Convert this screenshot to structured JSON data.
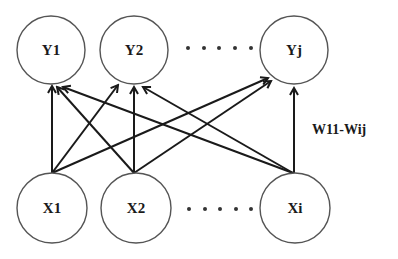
{
  "diagram": {
    "type": "bipartite-network",
    "output_nodes": [
      {
        "id": "Y1",
        "label": "Y1",
        "cx": 51,
        "cy": 50,
        "r": 34
      },
      {
        "id": "Y2",
        "label": "Y2",
        "cx": 134,
        "cy": 50,
        "r": 34
      },
      {
        "id": "Yj",
        "label": "Yj",
        "cx": 294,
        "cy": 50,
        "r": 34
      }
    ],
    "input_nodes": [
      {
        "id": "X1",
        "label": "X1",
        "cx": 52,
        "cy": 208,
        "r": 35
      },
      {
        "id": "X2",
        "label": "X2",
        "cx": 136,
        "cy": 208,
        "r": 35
      },
      {
        "id": "Xi",
        "label": "Xi",
        "cx": 295,
        "cy": 208,
        "r": 35
      }
    ],
    "edges": [
      {
        "from": "X1",
        "to": "Y1",
        "x1": 52,
        "y1": 173,
        "x2": 52,
        "y2": 86
      },
      {
        "from": "X1",
        "to": "Y2",
        "x1": 52,
        "y1": 173,
        "x2": 118,
        "y2": 85
      },
      {
        "from": "X1",
        "to": "Yj",
        "x1": 52,
        "y1": 173,
        "x2": 268,
        "y2": 78
      },
      {
        "from": "X2",
        "to": "Y1",
        "x1": 134,
        "y1": 173,
        "x2": 57,
        "y2": 87
      },
      {
        "from": "X2",
        "to": "Y2",
        "x1": 134,
        "y1": 173,
        "x2": 134,
        "y2": 87
      },
      {
        "from": "X2",
        "to": "Yj",
        "x1": 134,
        "y1": 173,
        "x2": 271,
        "y2": 81
      },
      {
        "from": "Xi",
        "to": "Y1",
        "x1": 293,
        "y1": 173,
        "x2": 63,
        "y2": 87
      },
      {
        "from": "Xi",
        "to": "Y2",
        "x1": 293,
        "y1": 173,
        "x2": 143,
        "y2": 87
      },
      {
        "from": "Xi",
        "to": "Yj",
        "x1": 294,
        "y1": 173,
        "x2": 294,
        "y2": 88
      }
    ],
    "ellipsis_top": {
      "y": 48,
      "xs": [
        188,
        204,
        219,
        235,
        251
      ]
    },
    "ellipsis_bottom": {
      "y": 209,
      "xs": [
        189,
        205,
        220,
        236,
        251
      ]
    },
    "weight_label": {
      "text": "W11-Wij",
      "x": 312,
      "y": 134
    }
  }
}
